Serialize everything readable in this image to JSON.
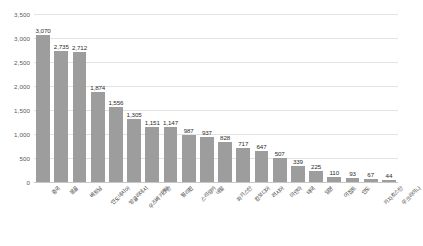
{
  "chart_data": {
    "type": "bar",
    "title": "",
    "subtitle": "",
    "xlabel": "",
    "ylabel": "",
    "ylim": [
      0,
      3500
    ],
    "ytick_step": 500,
    "grid": true,
    "legend": false,
    "legend_position": "none",
    "bar_color": "#9d9d9d",
    "gridline_color": "#e2e2e2",
    "axis_color": "#c8c8c8",
    "value_label_color": "#2b2b2b",
    "ytick_labels": [
      "0",
      "500",
      "1,000",
      "1,500",
      "2,000",
      "2,500",
      "3,000",
      "3,500"
    ],
    "ytick_values": [
      0,
      500,
      1000,
      1500,
      2000,
      2500,
      3000,
      3500
    ],
    "categories": [
      "중국",
      "몽골",
      "베트남",
      "인도네시아",
      "방글라데시",
      "우즈베키스탄",
      "기타",
      "필리핀",
      "스리랑카",
      "네팔",
      "파키스탄",
      "캄보디아",
      "러시아",
      "미얀마",
      "태국",
      "일본",
      "이집트",
      "인도",
      "카자흐스탄",
      "우크라이나"
    ],
    "values": [
      3070,
      2735,
      2712,
      1874,
      1556,
      1305,
      1151,
      1147,
      987,
      937,
      828,
      717,
      647,
      507,
      339,
      225,
      110,
      93,
      67,
      44
    ],
    "value_labels": [
      "3,070",
      "2,735",
      "2,712",
      "1,874",
      "1,556",
      "1,305",
      "1,151",
      "1,147",
      "987",
      "937",
      "828",
      "717",
      "647",
      "507",
      "339",
      "225",
      "110",
      "93",
      "67",
      "44"
    ]
  }
}
